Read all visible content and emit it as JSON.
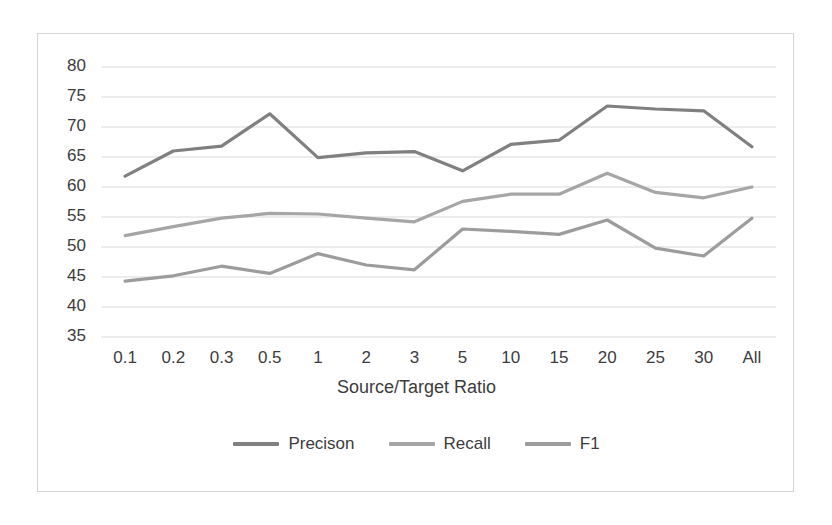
{
  "chart_data": {
    "type": "line",
    "title": "",
    "xlabel": "Source/Target Ratio",
    "ylabel": "",
    "categories": [
      "0.1",
      "0.2",
      "0.3",
      "0.5",
      "1",
      "2",
      "3",
      "5",
      "10",
      "15",
      "20",
      "25",
      "30",
      "All"
    ],
    "ylim": [
      35,
      80
    ],
    "yticks": [
      35,
      40,
      45,
      50,
      55,
      60,
      65,
      70,
      75,
      80
    ],
    "grid": true,
    "legend_position": "bottom",
    "series": [
      {
        "name": "Precison",
        "color": "#808080",
        "values": [
          61.8,
          66.0,
          66.8,
          72.2,
          64.9,
          65.7,
          65.9,
          62.7,
          67.1,
          67.8,
          73.5,
          73.0,
          72.7,
          66.7
        ]
      },
      {
        "name": "Recall",
        "color": "#a6a6a6",
        "values": [
          51.9,
          53.4,
          54.8,
          55.6,
          55.5,
          54.8,
          54.2,
          57.6,
          58.8,
          58.8,
          62.3,
          59.1,
          58.2,
          60.0
        ]
      },
      {
        "name": "F1",
        "color": "#9c9c9c",
        "values": [
          44.3,
          45.2,
          46.8,
          45.6,
          48.9,
          47.0,
          46.2,
          53.0,
          52.6,
          52.1,
          54.5,
          49.8,
          48.5,
          54.8
        ]
      }
    ]
  },
  "axis": {
    "x_title": "Source/Target Ratio",
    "ytick_labels": [
      "80",
      "75",
      "70",
      "65",
      "60",
      "55",
      "50",
      "45",
      "40",
      "35"
    ],
    "xtick_labels": [
      "0.1",
      "0.2",
      "0.3",
      "0.5",
      "1",
      "2",
      "3",
      "5",
      "10",
      "15",
      "20",
      "25",
      "30",
      "All"
    ]
  },
  "legend": {
    "items": [
      {
        "label": "Precison",
        "color": "#808080"
      },
      {
        "label": "Recall",
        "color": "#a6a6a6"
      },
      {
        "label": "F1",
        "color": "#9c9c9c"
      }
    ]
  }
}
